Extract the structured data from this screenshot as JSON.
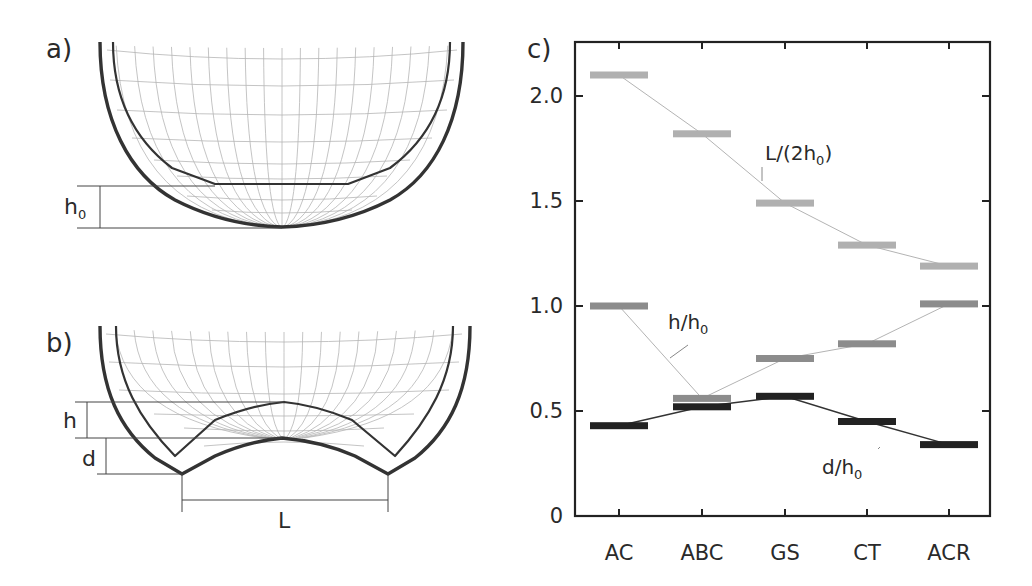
{
  "panels": {
    "a": {
      "label": "a)",
      "dim_label": "h",
      "dim_sub": "0"
    },
    "b": {
      "label": "b)",
      "h_label": "h",
      "d_label": "d",
      "L_label": "L"
    },
    "c": {
      "label": "c)"
    }
  },
  "colors": {
    "L_series": "#b0b0b0",
    "h_series": "#8c8c8c",
    "d_series": "#222222",
    "frame": "#222222"
  },
  "chart_data": {
    "type": "line",
    "title": "",
    "xlabel": "",
    "ylabel": "",
    "categories": [
      "AC",
      "ABC",
      "GS",
      "CT",
      "ACR"
    ],
    "yticks": [
      "0",
      "0.5",
      "1.0",
      "1.5",
      "2.0"
    ],
    "ylim": [
      0,
      2.25
    ],
    "grid": false,
    "legend": "inline annotations",
    "series": [
      {
        "name": "L/(2h0)",
        "label_main": "L/(2h",
        "label_sub": "0",
        "label_end": ")",
        "values": [
          2.1,
          1.82,
          1.49,
          1.29,
          1.19
        ]
      },
      {
        "name": "h/h0",
        "label_main": "h/h",
        "label_sub": "0",
        "label_end": "",
        "values": [
          1.0,
          0.56,
          0.75,
          0.82,
          1.01
        ]
      },
      {
        "name": "d/h0",
        "label_main": "d/h",
        "label_sub": "0",
        "label_end": "",
        "values": [
          0.43,
          0.52,
          0.57,
          0.45,
          0.34
        ]
      }
    ]
  }
}
